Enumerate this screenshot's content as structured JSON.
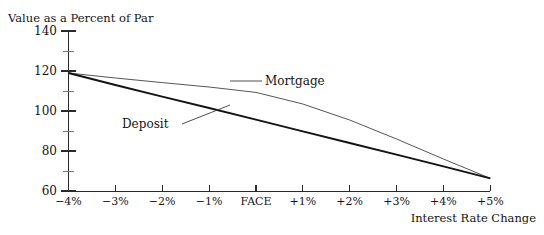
{
  "chart_data": {
    "type": "line",
    "title": "",
    "ylabel": "Value as a Percent of Par",
    "xlabel": "Interest Rate Change",
    "categories": [
      "-4%",
      "-3%",
      "-2%",
      "-1%",
      "FACE",
      "+1%",
      "+2%",
      "+3%",
      "+4%",
      "+5%"
    ],
    "x": [
      -4,
      -3,
      -2,
      -1,
      0,
      1,
      2,
      3,
      4,
      5
    ],
    "xlim": [
      -4,
      5
    ],
    "ylim": [
      60,
      140
    ],
    "y_ticks": [
      60,
      80,
      100,
      120,
      140
    ],
    "y_tick_labels": [
      "60",
      "80",
      "100",
      "120",
      "140"
    ],
    "x_tick_labels": [
      "−4%",
      "−3%",
      "−2%",
      "−1%",
      "FACE",
      "+1%",
      "+2%",
      "+3%",
      "+4%",
      "+5%"
    ],
    "grid": false,
    "legend_position": "inline-callout",
    "series": [
      {
        "name": "Mortgage",
        "style": "thin",
        "values": [
          119.0,
          116.5,
          114.2,
          112.0,
          109.3,
          103.5,
          95.5,
          86.0,
          76.0,
          66.3
        ]
      },
      {
        "name": "Deposit",
        "style": "thick",
        "values": [
          119.0,
          113.0,
          107.2,
          101.5,
          95.7,
          89.8,
          84.0,
          78.2,
          72.3,
          66.3
        ]
      }
    ],
    "annotations": [
      {
        "text": "Mortgage",
        "attaches_to": "Mortgage"
      },
      {
        "text": "Deposit",
        "attaches_to": "Deposit"
      }
    ]
  }
}
